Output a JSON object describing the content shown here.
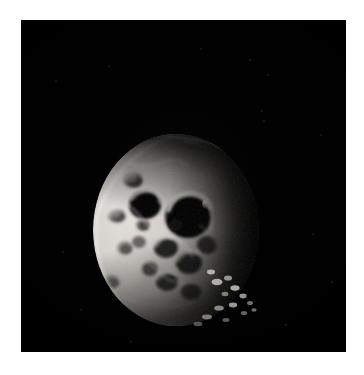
{
  "page": {
    "width": 364,
    "height": 375,
    "background_color": "#ffffff",
    "margin_color": "#ffffff"
  },
  "image_frame": {
    "name": "spacecraft-image-plate",
    "x": 21,
    "y": 20,
    "width": 325,
    "height": 332,
    "background_color": "#000000",
    "alt_text": "Grayscale spacecraft photograph of a small heavily cratered icy moon lit from the left, seen as a crescent against black space"
  },
  "scene": {
    "subject": "icy moon",
    "lighting": "illuminated from the left, terminator on the right",
    "phase": "crescent",
    "sky_color": "#000000",
    "highlight_color": "#e8e6e2",
    "midtone_color": "#9a978f",
    "shadow_color": "#000000"
  },
  "moon": {
    "name": "cratered-moon-body",
    "center_x": 155,
    "center_y": 210,
    "radius_x": 82,
    "radius_y": 95,
    "bounds": {
      "left": 75,
      "top": 115,
      "right": 237,
      "bottom": 307
    }
  },
  "features": {
    "large_crater": {
      "name": "large-dark-crater",
      "cx": 167,
      "cy": 197,
      "rx": 22,
      "ry": 20,
      "description": "large shadow-filled crater with bright illuminated rim"
    },
    "secondary_crater": {
      "name": "secondary-dark-crater",
      "cx": 124,
      "cy": 185,
      "rx": 15,
      "ry": 13
    },
    "terminator_knobs": {
      "name": "terminator-peaks",
      "count": 14,
      "description": "scattered bright peaks catching sunlight beyond the terminator at lower right"
    },
    "limb_sliver": {
      "name": "upper-limb-sliver",
      "description": "thin bright arc along the upper illuminated limb"
    }
  },
  "noise_specks": [
    {
      "x": 247,
      "y": 55,
      "r": 1.2
    },
    {
      "x": 241,
      "y": 91,
      "r": 1.0
    },
    {
      "x": 243,
      "y": 101,
      "r": 1.4
    },
    {
      "x": 229,
      "y": 40,
      "r": 0.9
    },
    {
      "x": 300,
      "y": 115,
      "r": 0.9
    },
    {
      "x": 42,
      "y": 232,
      "r": 0.8
    },
    {
      "x": 60,
      "y": 290,
      "r": 0.8
    },
    {
      "x": 110,
      "y": 322,
      "r": 0.9
    },
    {
      "x": 265,
      "y": 305,
      "r": 0.9
    },
    {
      "x": 292,
      "y": 214,
      "r": 0.8
    },
    {
      "x": 35,
      "y": 61,
      "r": 0.8
    },
    {
      "x": 180,
      "y": 29,
      "r": 0.7
    },
    {
      "x": 311,
      "y": 262,
      "r": 0.7
    },
    {
      "x": 88,
      "y": 46,
      "r": 0.7
    }
  ]
}
